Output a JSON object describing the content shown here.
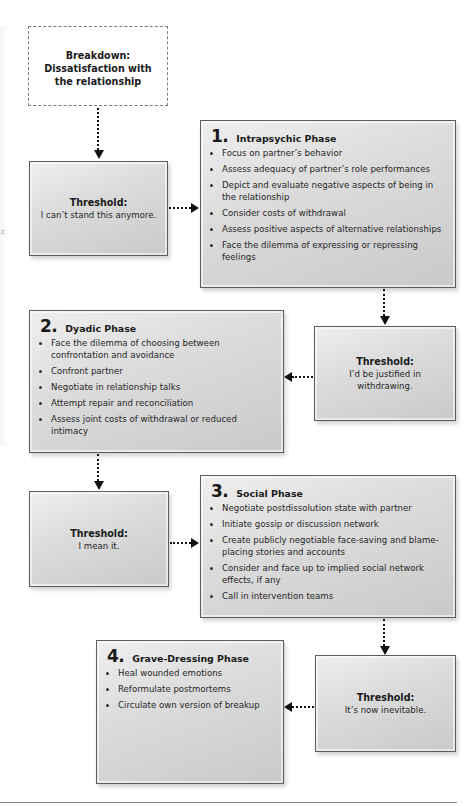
{
  "diagram": {
    "breakdown": {
      "text": "Breakdown:\nDissatisfaction with\nthe relationship"
    },
    "thresholds": [
      {
        "title": "Threshold:",
        "text": "I can’t stand this anymore."
      },
      {
        "title": "Threshold:",
        "text": "I’d be justified in\nwithdrawing."
      },
      {
        "title": "Threshold:",
        "text": "I mean it."
      },
      {
        "title": "Threshold:",
        "text": "It’s now inevitable."
      }
    ],
    "phases": [
      {
        "number": "1.",
        "title": "Intrapsychic Phase",
        "items": [
          "Focus on partner’s behavior",
          "Assess adequacy of partner’s role performances",
          "Depict and evaluate negative aspects of being in the relationship",
          "Consider costs of withdrawal",
          "Assess positive aspects of alternative relationships",
          "Face the dilemma of expressing or repressing feelings"
        ]
      },
      {
        "number": "2.",
        "title": "Dyadic Phase",
        "items": [
          "Face the dilemma of choosing between confrontation and avoidance",
          "Confront partner",
          "Negotiate in relationship talks",
          "Attempt repair and reconciliation",
          "Assess joint costs of withdrawal or reduced intimacy"
        ]
      },
      {
        "number": "3.",
        "title": "Social Phase",
        "items": [
          "Negotiate postdissolution state with partner",
          "Initiate gossip or discussion network",
          "Create publicly negotiable face-saving and blame-placing stories and accounts",
          "Consider and face up to implied social network effects, if any",
          "Call in intervention teams"
        ]
      },
      {
        "number": "4.",
        "title": "Grave-Dressing Phase",
        "items": [
          "Heal wounded emotions",
          "Reformulate postmortems",
          "Circulate own version of breakup"
        ]
      }
    ],
    "margin_mark": "c"
  }
}
